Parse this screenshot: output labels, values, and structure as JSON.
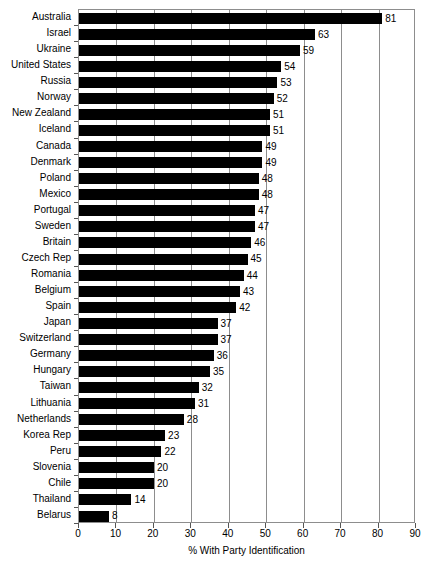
{
  "chart_data": {
    "type": "bar",
    "orientation": "horizontal",
    "title": "",
    "xlabel": "% With Party Identification",
    "ylabel": "",
    "xlim": [
      0,
      90
    ],
    "xticks": [
      0,
      10,
      20,
      30,
      40,
      50,
      60,
      70,
      80,
      90
    ],
    "grid": true,
    "legend": false,
    "bar_color": "#000000",
    "frame_color": "#8d8d8d",
    "categories": [
      "Australia",
      "Israel",
      "Ukraine",
      "United States",
      "Russia",
      "Norway",
      "New Zealand",
      "Iceland",
      "Canada",
      "Denmark",
      "Poland",
      "Mexico",
      "Portugal",
      "Sweden",
      "Britain",
      "Czech Rep",
      "Romania",
      "Belgium",
      "Spain",
      "Japan",
      "Switzerland",
      "Germany",
      "Hungary",
      "Taiwan",
      "Lithuania",
      "Netherlands",
      "Korea Rep",
      "Peru",
      "Slovenia",
      "Chile",
      "Thailand",
      "Belarus"
    ],
    "values": [
      81,
      63,
      59,
      54,
      53,
      52,
      51,
      51,
      49,
      49,
      48,
      48,
      47,
      47,
      46,
      45,
      44,
      43,
      42,
      37,
      37,
      36,
      35,
      32,
      31,
      28,
      23,
      22,
      20,
      20,
      14,
      8
    ]
  }
}
